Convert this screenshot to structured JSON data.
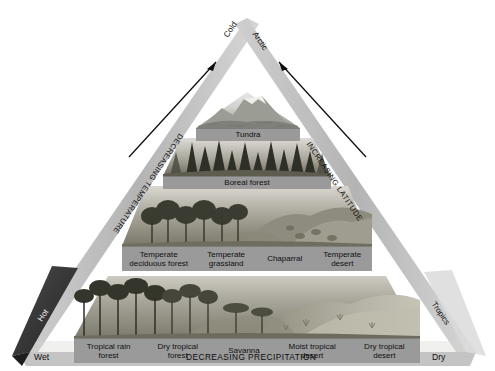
{
  "diagram": {
    "type": "pyramid-diagram"
  },
  "apex": {
    "left_label": "Cold",
    "right_label": "Arctic"
  },
  "edges": {
    "left_axis": "DECREASING TEMPERATURE",
    "right_axis": "INCREASING LATITUDE",
    "left_corner": "Hot",
    "right_corner": "Tropics"
  },
  "base_axis": {
    "left_end": "Wet",
    "center": "DECREASING PRECIPITATION",
    "right_end": "Dry"
  },
  "tiers": [
    {
      "name": "tier-1-tundra",
      "biomes": [
        {
          "label": "Tundra"
        }
      ]
    },
    {
      "name": "tier-2-boreal",
      "biomes": [
        {
          "label": "Boreal forest"
        }
      ]
    },
    {
      "name": "tier-3-temperate",
      "biomes": [
        {
          "label": "Temperate deciduous forest"
        },
        {
          "label": "Temperate grassland"
        },
        {
          "label": "Chaparral"
        },
        {
          "label": "Temperate desert"
        }
      ]
    },
    {
      "name": "tier-4-tropical",
      "biomes": [
        {
          "label": "Tropical rain forest"
        },
        {
          "label": "Dry tropical forest"
        },
        {
          "label": "Savanna"
        },
        {
          "label": "Moist tropical desert"
        },
        {
          "label": "Dry tropical desert"
        }
      ]
    }
  ],
  "colors": {
    "band": "#9a9a9a",
    "edge_band": "#b9b9b9",
    "dark_edge": "#3a3a3a",
    "arrow": "#111111",
    "background": "#ffffff"
  }
}
